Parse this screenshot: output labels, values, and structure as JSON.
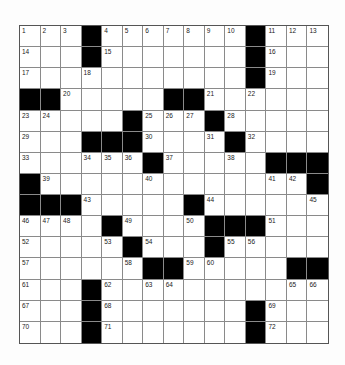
{
  "puzzle": {
    "rows": 15,
    "cols": 15,
    "black_color": "#000000",
    "blocks": [
      [
        0,
        3
      ],
      [
        0,
        11
      ],
      [
        1,
        3
      ],
      [
        1,
        11
      ],
      [
        2,
        11
      ],
      [
        3,
        0
      ],
      [
        3,
        1
      ],
      [
        3,
        7
      ],
      [
        3,
        8
      ],
      [
        4,
        5
      ],
      [
        4,
        9
      ],
      [
        5,
        3
      ],
      [
        5,
        4
      ],
      [
        5,
        5
      ],
      [
        5,
        10
      ],
      [
        6,
        6
      ],
      [
        6,
        12
      ],
      [
        6,
        13
      ],
      [
        6,
        14
      ],
      [
        7,
        0
      ],
      [
        7,
        14
      ],
      [
        8,
        0
      ],
      [
        8,
        1
      ],
      [
        8,
        2
      ],
      [
        8,
        8
      ],
      [
        9,
        4
      ],
      [
        9,
        9
      ],
      [
        9,
        10
      ],
      [
        9,
        11
      ],
      [
        10,
        5
      ],
      [
        10,
        9
      ],
      [
        11,
        6
      ],
      [
        11,
        7
      ],
      [
        11,
        13
      ],
      [
        11,
        14
      ],
      [
        12,
        3
      ],
      [
        13,
        3
      ],
      [
        13,
        11
      ],
      [
        14,
        3
      ],
      [
        14,
        11
      ]
    ],
    "numbers": [
      [
        0,
        0,
        "1"
      ],
      [
        0,
        1,
        "2"
      ],
      [
        0,
        2,
        "3"
      ],
      [
        0,
        4,
        "4"
      ],
      [
        0,
        5,
        "5"
      ],
      [
        0,
        6,
        "6"
      ],
      [
        0,
        7,
        "7"
      ],
      [
        0,
        8,
        "8"
      ],
      [
        0,
        9,
        "9"
      ],
      [
        0,
        10,
        "10"
      ],
      [
        0,
        12,
        "11"
      ],
      [
        0,
        13,
        "12"
      ],
      [
        0,
        14,
        "13"
      ],
      [
        1,
        0,
        "14"
      ],
      [
        1,
        4,
        "15"
      ],
      [
        1,
        12,
        "16"
      ],
      [
        2,
        0,
        "17"
      ],
      [
        2,
        3,
        "18"
      ],
      [
        2,
        12,
        "19"
      ],
      [
        3,
        2,
        "20"
      ],
      [
        3,
        9,
        "21"
      ],
      [
        3,
        11,
        "22"
      ],
      [
        4,
        0,
        "23"
      ],
      [
        4,
        1,
        "24"
      ],
      [
        4,
        6,
        "25"
      ],
      [
        4,
        7,
        "26"
      ],
      [
        4,
        8,
        "27"
      ],
      [
        4,
        10,
        "28"
      ],
      [
        5,
        0,
        "29"
      ],
      [
        5,
        6,
        "30"
      ],
      [
        5,
        9,
        "31"
      ],
      [
        5,
        11,
        "32"
      ],
      [
        6,
        0,
        "33"
      ],
      [
        6,
        3,
        "34"
      ],
      [
        6,
        4,
        "35"
      ],
      [
        6,
        5,
        "36"
      ],
      [
        6,
        7,
        "37"
      ],
      [
        6,
        10,
        "38"
      ],
      [
        7,
        1,
        "39"
      ],
      [
        7,
        6,
        "40"
      ],
      [
        7,
        12,
        "41"
      ],
      [
        7,
        13,
        "42"
      ],
      [
        8,
        3,
        "43"
      ],
      [
        8,
        9,
        "44"
      ],
      [
        8,
        14,
        "45"
      ],
      [
        9,
        0,
        "46"
      ],
      [
        9,
        1,
        "47"
      ],
      [
        9,
        2,
        "48"
      ],
      [
        9,
        5,
        "49"
      ],
      [
        9,
        8,
        "50"
      ],
      [
        9,
        12,
        "51"
      ],
      [
        10,
        0,
        "52"
      ],
      [
        10,
        4,
        "53"
      ],
      [
        10,
        6,
        "54"
      ],
      [
        10,
        10,
        "55"
      ],
      [
        10,
        11,
        "56"
      ],
      [
        11,
        0,
        "57"
      ],
      [
        11,
        5,
        "58"
      ],
      [
        11,
        8,
        "59"
      ],
      [
        11,
        9,
        "60"
      ],
      [
        12,
        0,
        "61"
      ],
      [
        12,
        4,
        "62"
      ],
      [
        12,
        6,
        "63"
      ],
      [
        12,
        7,
        "64"
      ],
      [
        12,
        13,
        "65"
      ],
      [
        12,
        14,
        "66"
      ],
      [
        13,
        0,
        "67"
      ],
      [
        13,
        4,
        "68"
      ],
      [
        13,
        12,
        "69"
      ],
      [
        14,
        0,
        "70"
      ],
      [
        14,
        4,
        "71"
      ],
      [
        14,
        12,
        "72"
      ]
    ]
  }
}
